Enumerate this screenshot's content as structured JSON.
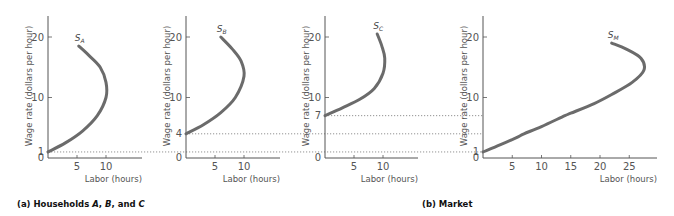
{
  "chart_data": [
    {
      "id": "household-a",
      "type": "line",
      "title": "Household A",
      "curve_label": "S",
      "curve_sub": "A",
      "xlabel": "Labor (hours)",
      "ylabel": "Wage rate (dollars per hour)",
      "x_ticks": [
        5,
        10
      ],
      "y_ticks": [
        0,
        1,
        10,
        20
      ],
      "xlim": [
        0,
        15
      ],
      "ylim": [
        0,
        23
      ],
      "reservation_wage": 1,
      "points": [
        [
          0,
          1
        ],
        [
          3,
          2.5
        ],
        [
          6,
          4.5
        ],
        [
          8.5,
          7
        ],
        [
          10,
          10
        ],
        [
          10,
          12.5
        ],
        [
          9,
          15
        ],
        [
          7,
          17
        ],
        [
          5.3,
          18.5
        ]
      ]
    },
    {
      "id": "household-b",
      "type": "line",
      "title": "Household B",
      "curve_label": "S",
      "curve_sub": "B",
      "xlabel": "Labor (hours)",
      "ylabel": "Wage rate (dollars per hour)",
      "x_ticks": [
        5,
        10
      ],
      "y_ticks": [
        0,
        4,
        10,
        20
      ],
      "xlim": [
        0,
        15
      ],
      "ylim": [
        0,
        23
      ],
      "reservation_wage": 4,
      "points": [
        [
          0,
          4
        ],
        [
          3,
          5.5
        ],
        [
          6,
          7.5
        ],
        [
          8.5,
          10
        ],
        [
          10,
          13.5
        ],
        [
          9.5,
          16
        ],
        [
          8,
          18
        ],
        [
          6,
          20
        ]
      ]
    },
    {
      "id": "household-c",
      "type": "line",
      "title": "Household C",
      "curve_label": "S",
      "curve_sub": "C",
      "xlabel": "Labor (hours)",
      "ylabel": "Wage rate (dollars per hour)",
      "x_ticks": [
        5,
        10
      ],
      "y_ticks": [
        0,
        7,
        10,
        20
      ],
      "xlim": [
        0,
        15
      ],
      "ylim": [
        0,
        23
      ],
      "reservation_wage": 7,
      "points": [
        [
          0,
          7
        ],
        [
          3,
          8.3
        ],
        [
          6,
          9.7
        ],
        [
          8.5,
          11.5
        ],
        [
          10,
          14
        ],
        [
          10.3,
          16.5
        ],
        [
          9.8,
          18.5
        ],
        [
          9,
          20.5
        ]
      ]
    },
    {
      "id": "market",
      "type": "line",
      "title": "Market",
      "curve_label": "S",
      "curve_sub": "M",
      "xlabel": "Labor (hours)",
      "ylabel": "Wage rate (dollars per hour)",
      "x_ticks": [
        5,
        10,
        15,
        20,
        25
      ],
      "y_ticks": [
        0,
        1,
        10,
        20
      ],
      "xlim": [
        0,
        30
      ],
      "ylim": [
        0,
        23
      ],
      "points": [
        [
          0,
          1
        ],
        [
          3,
          2.2
        ],
        [
          6,
          3.5
        ],
        [
          7,
          4
        ],
        [
          10,
          5.2
        ],
        [
          14,
          7
        ],
        [
          15,
          7.4
        ],
        [
          19,
          9
        ],
        [
          22,
          10.5
        ],
        [
          25.5,
          12.5
        ],
        [
          27.5,
          14.5
        ],
        [
          27,
          16.5
        ],
        [
          24.5,
          18
        ],
        [
          22,
          19
        ]
      ]
    }
  ],
  "captions": {
    "a_prefix": "(a) Households ",
    "a_A": "A",
    "a_sep1": ", ",
    "a_B": "B",
    "a_sep2": ", and ",
    "a_C": "C",
    "b": "(b) Market"
  }
}
